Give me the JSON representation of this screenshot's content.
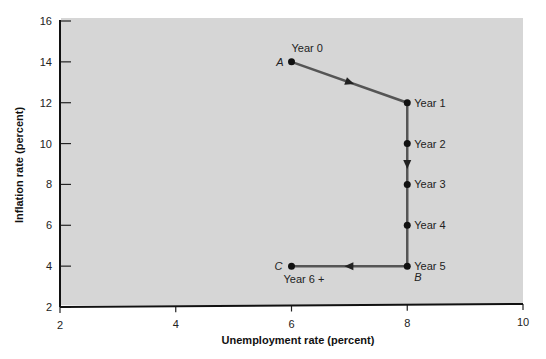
{
  "chart_data": {
    "type": "line",
    "title": "",
    "xlabel": "Unemployment rate (percent)",
    "ylabel": "Inflation rate (percent)",
    "xlim": [
      2,
      10
    ],
    "ylim": [
      2,
      16
    ],
    "x_ticks": [
      "2",
      "4",
      "6",
      "8",
      "10"
    ],
    "y_ticks": [
      "2",
      "4",
      "6",
      "8",
      "10",
      "12",
      "14",
      "16"
    ],
    "grid": false,
    "legend": null,
    "background_color": "#d6d6d6",
    "line_color": "#555555",
    "series": [
      {
        "name": "Inflation-unemployment path",
        "points": [
          {
            "x": 6,
            "y": 14,
            "label": "Year 0",
            "letter": "A"
          },
          {
            "x": 8,
            "y": 12,
            "label": "Year 1",
            "letter": ""
          },
          {
            "x": 8,
            "y": 10,
            "label": "Year 2",
            "letter": ""
          },
          {
            "x": 8,
            "y": 8,
            "label": "Year 3",
            "letter": ""
          },
          {
            "x": 8,
            "y": 6,
            "label": "Year 4",
            "letter": ""
          },
          {
            "x": 8,
            "y": 4,
            "label": "Year 5",
            "letter": "B"
          },
          {
            "x": 6,
            "y": 4,
            "label": "Year 6 +",
            "letter": "C"
          }
        ]
      }
    ],
    "annotations": [
      "A",
      "B",
      "C",
      "direction arrows along path"
    ]
  }
}
